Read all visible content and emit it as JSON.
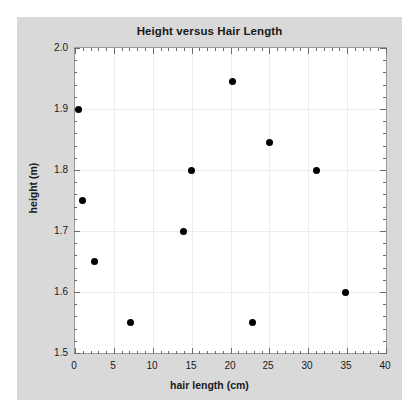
{
  "chart_data": {
    "type": "scatter",
    "title": "Height versus Hair Length",
    "xlabel": "hair length (cm)",
    "ylabel": "height (m)",
    "xlim": [
      0,
      40
    ],
    "ylim": [
      1.5,
      2.0
    ],
    "xticks": [
      0,
      5,
      10,
      15,
      20,
      25,
      30,
      35,
      40
    ],
    "xticklabels": [
      "0",
      "5",
      "10",
      "15",
      "20",
      "25",
      "30",
      "35",
      "40"
    ],
    "yticks": [
      1.5,
      1.6,
      1.7,
      1.8,
      1.9,
      2.0
    ],
    "yticklabels": [
      "1.5",
      "1.6",
      "1.7",
      "1.8",
      "1.9",
      "2.0"
    ],
    "xminor_step": 1,
    "yminor_step": 0.02,
    "grid": true,
    "legend": null,
    "marker": "circle",
    "marker_color": "#000000",
    "points": [
      {
        "x": 0.5,
        "y": 1.9
      },
      {
        "x": 1.0,
        "y": 1.75
      },
      {
        "x": 2.5,
        "y": 1.65
      },
      {
        "x": 7.2,
        "y": 1.55
      },
      {
        "x": 14.0,
        "y": 1.7
      },
      {
        "x": 15.0,
        "y": 1.8
      },
      {
        "x": 20.2,
        "y": 1.945
      },
      {
        "x": 22.8,
        "y": 1.55
      },
      {
        "x": 25.0,
        "y": 1.845
      },
      {
        "x": 31.0,
        "y": 1.8
      },
      {
        "x": 34.8,
        "y": 1.6
      }
    ]
  },
  "colors": {
    "figure_background": "#d9d9d9",
    "page_background": "#ffffff",
    "axes_background": "#ffffff",
    "grid": "#ececec",
    "frame": "#9a9a9a",
    "text": "#1a1a1a",
    "marker": "#000000"
  }
}
